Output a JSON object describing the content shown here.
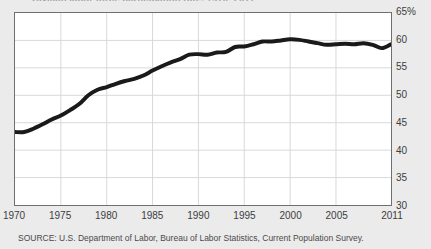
{
  "chart_data": {
    "type": "line",
    "title": "Civilian labor force participation rate, 1970–2011",
    "subtitle": "",
    "xlabel": "",
    "ylabel": "",
    "ylim": [
      30,
      65
    ],
    "xlim": [
      1970,
      2011
    ],
    "grid": true,
    "legend": null,
    "line_color": "#1a1a1a",
    "line_width": 4,
    "plot_background": "#ffffff",
    "page_background": "#ebebeb",
    "grid_color": "#d9d9d9",
    "axis_color": "#6f6f6f",
    "y_ticks": [
      {
        "value": 65,
        "label": "65%"
      },
      {
        "value": 60,
        "label": "60"
      },
      {
        "value": 55,
        "label": "55"
      },
      {
        "value": 50,
        "label": "50"
      },
      {
        "value": 45,
        "label": "45"
      },
      {
        "value": 40,
        "label": "40"
      },
      {
        "value": 35,
        "label": "35"
      },
      {
        "value": 30,
        "label": "30"
      }
    ],
    "x_ticks": [
      {
        "value": 1970,
        "label": "1970"
      },
      {
        "value": 1975,
        "label": "1975"
      },
      {
        "value": 1980,
        "label": "1980"
      },
      {
        "value": 1985,
        "label": "1985"
      },
      {
        "value": 1990,
        "label": "1990"
      },
      {
        "value": 1995,
        "label": "1995"
      },
      {
        "value": 2000,
        "label": "2000"
      },
      {
        "value": 2005,
        "label": "2005"
      },
      {
        "value": 2011,
        "label": "2011"
      }
    ],
    "x": [
      1970,
      1971,
      1972,
      1973,
      1974,
      1975,
      1976,
      1977,
      1978,
      1979,
      1980,
      1981,
      1982,
      1983,
      1984,
      1985,
      1986,
      1987,
      1988,
      1989,
      1990,
      1991,
      1992,
      1993,
      1994,
      1995,
      1996,
      1997,
      1998,
      1999,
      2000,
      2001,
      2002,
      2003,
      2004,
      2005,
      2006,
      2007,
      2008,
      2009,
      2010,
      2011
    ],
    "values": [
      43.3,
      43.3,
      43.9,
      44.7,
      45.6,
      46.3,
      47.3,
      48.4,
      50.0,
      51.0,
      51.5,
      52.1,
      52.6,
      53.0,
      53.6,
      54.5,
      55.3,
      56.0,
      56.6,
      57.4,
      57.5,
      57.4,
      57.8,
      57.9,
      58.8,
      58.9,
      59.3,
      59.8,
      59.8,
      60.0,
      60.2,
      60.1,
      59.8,
      59.5,
      59.2,
      59.3,
      59.4,
      59.3,
      59.5,
      59.2,
      58.6,
      59.3
    ],
    "series_name": "Labor force participation rate"
  },
  "source": {
    "text": "SOURCE: U.S. Department of Labor, Bureau of Labor Statistics, Current Population Survey."
  }
}
